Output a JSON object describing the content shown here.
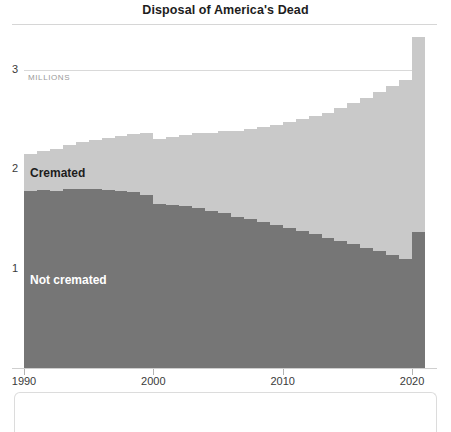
{
  "chart_data": {
    "type": "bar",
    "title": "Disposal of America's Dead",
    "subtitle": "",
    "xlabel": "",
    "ylabel": "MILLIONS",
    "unit_label": "MILLIONS",
    "stacked": true,
    "grid": true,
    "legend_position": "in-chart",
    "xlim": [
      1990,
      2020
    ],
    "ylim": [
      0,
      3.4
    ],
    "yticks": [
      "1",
      "2",
      "3"
    ],
    "ytick_values": [
      1,
      2,
      3
    ],
    "xticks": [
      "1990",
      "2000",
      "2010",
      "2020"
    ],
    "xtick_values": [
      1990,
      2000,
      2010,
      2020
    ],
    "categories": [
      1990,
      1991,
      1992,
      1993,
      1994,
      1995,
      1996,
      1997,
      1998,
      1999,
      2000,
      2001,
      2002,
      2003,
      2004,
      2005,
      2006,
      2007,
      2008,
      2009,
      2010,
      2011,
      2012,
      2013,
      2014,
      2015,
      2016,
      2017,
      2018,
      2019,
      2020
    ],
    "series": [
      {
        "name": "Not cremated",
        "color": "#767676",
        "values": [
          1.78,
          1.79,
          1.78,
          1.8,
          1.8,
          1.8,
          1.79,
          1.78,
          1.77,
          1.74,
          1.65,
          1.64,
          1.63,
          1.61,
          1.58,
          1.56,
          1.52,
          1.5,
          1.47,
          1.44,
          1.41,
          1.38,
          1.35,
          1.31,
          1.28,
          1.25,
          1.21,
          1.18,
          1.14,
          1.1,
          1.37
        ]
      },
      {
        "name": "Cremated",
        "color": "#c9c9c9",
        "values": [
          0.37,
          0.39,
          0.42,
          0.44,
          0.47,
          0.49,
          0.52,
          0.55,
          0.58,
          0.62,
          0.65,
          0.68,
          0.71,
          0.75,
          0.78,
          0.82,
          0.86,
          0.9,
          0.95,
          1.0,
          1.06,
          1.12,
          1.19,
          1.26,
          1.34,
          1.42,
          1.51,
          1.6,
          1.7,
          1.8,
          1.96
        ]
      }
    ],
    "annotations": [
      {
        "name": "cremated-label",
        "text": "Cremated",
        "color": "#1d1d1d"
      },
      {
        "name": "not-cremated-label",
        "text": "Not cremated",
        "color": "#ffffff"
      }
    ]
  }
}
